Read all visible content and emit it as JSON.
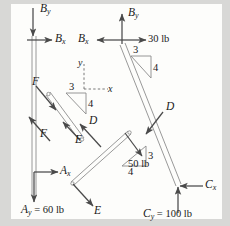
{
  "figure": {
    "type": "free-body-diagram",
    "background_color": "#d8d8d6",
    "paper_color": "#fdfdfb",
    "ink_color": "#3a3a3a",
    "text_color": "#1a1a1a"
  },
  "axes_indicator": {
    "y_label": "y",
    "x_label": "x",
    "style": "dashed"
  },
  "slope_triangles": [
    {
      "id": "upper-right",
      "rise": "3",
      "run": "4"
    },
    {
      "id": "left-member",
      "rise": "3",
      "run": "4"
    },
    {
      "id": "lower-right",
      "rise": "3",
      "run": "4"
    }
  ],
  "labels": {
    "by_left": {
      "base": "B",
      "sub": "y",
      "direction": "down"
    },
    "bx_left": {
      "base": "B",
      "sub": "x",
      "direction": "right"
    },
    "bx_right": {
      "base": "B",
      "sub": "x",
      "direction": "left"
    },
    "by_right": {
      "base": "B",
      "sub": "y",
      "direction": "up"
    },
    "load_30": {
      "text": "30 lb",
      "direction": "right"
    },
    "force_f_upper": {
      "base": "F",
      "sub": "",
      "direction": "down-right"
    },
    "force_f_lower": {
      "base": "F",
      "sub": "",
      "direction": "up-left"
    },
    "force_d_upper": {
      "base": "D",
      "sub": "",
      "direction": "up-left"
    },
    "force_d_right": {
      "base": "D",
      "sub": "",
      "direction": "down-left"
    },
    "force_e_upper": {
      "base": "E",
      "sub": "",
      "direction": "up-left"
    },
    "force_e_lower": {
      "base": "E",
      "sub": "",
      "direction": "down-right"
    },
    "ax": {
      "base": "A",
      "sub": "x",
      "direction": "right"
    },
    "ay": {
      "base": "A",
      "sub": "y",
      "value": " = 60 lb",
      "direction": "down"
    },
    "cx": {
      "base": "C",
      "sub": "x",
      "direction": "left"
    },
    "cy": {
      "base": "C",
      "sub": "y",
      "value": " = 100 lb",
      "direction": "up"
    },
    "load_50": {
      "text": "50 lb",
      "direction": "down-right"
    }
  }
}
